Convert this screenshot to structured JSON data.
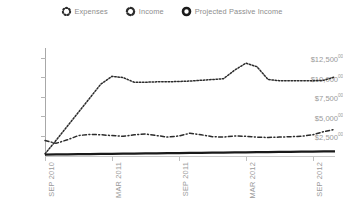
{
  "legend": {
    "items": [
      {
        "label": "Expenses",
        "icon": "dotted-ring-icon",
        "style": "dotted",
        "color": "#2b2b2b"
      },
      {
        "label": "Income",
        "icon": "dash-dot-ring-icon",
        "style": "dash-dot",
        "color": "#2b2b2b"
      },
      {
        "label": "Projected Passive Income",
        "icon": "solid-ring-icon",
        "style": "solid",
        "color": "#1a1a1a"
      }
    ]
  },
  "axes": {
    "y_ticks": [
      {
        "label": "$12,500",
        "cents": "00",
        "value": 12500
      },
      {
        "label": "$10,000",
        "cents": "00",
        "value": 10000
      },
      {
        "label": "$7,500",
        "cents": "00",
        "value": 7500
      },
      {
        "label": "$5,000",
        "cents": "00",
        "value": 5000
      },
      {
        "label": "$2,500",
        "cents": "00",
        "value": 2500
      }
    ],
    "x_ticks": [
      "SEP 2010",
      "MAR 2011",
      "SEP 2011",
      "MAR 2012",
      "SEP 2012"
    ]
  },
  "chart_data": {
    "type": "line",
    "title": "",
    "xlabel": "",
    "ylabel": "",
    "ylim": [
      0,
      13750
    ],
    "grid": false,
    "legend_position": "top-center",
    "x": [
      "SEP 2010",
      "OCT 2010",
      "NOV 2010",
      "DEC 2010",
      "JAN 2011",
      "FEB 2011",
      "MAR 2011",
      "APR 2011",
      "MAY 2011",
      "JUN 2011",
      "JUL 2011",
      "AUG 2011",
      "SEP 2011",
      "OCT 2011",
      "NOV 2011",
      "DEC 2011",
      "JAN 2012",
      "FEB 2012",
      "MAR 2012",
      "APR 2012",
      "MAY 2012",
      "JUN 2012",
      "JUL 2012",
      "AUG 2012",
      "SEP 2012",
      "OCT 2012",
      "NOV 2012"
    ],
    "series": [
      {
        "name": "Expenses",
        "style": "dotted",
        "color": "#2b2b2b",
        "values": [
          150,
          1900,
          3700,
          5500,
          7300,
          9100,
          10100,
          9950,
          9350,
          9350,
          9400,
          9400,
          9450,
          9500,
          9600,
          9700,
          9800,
          10900,
          11800,
          11350,
          9700,
          9550,
          9550,
          9550,
          9550,
          9600,
          10050
        ]
      },
      {
        "name": "Income",
        "style": "dash-dot",
        "color": "#2b2b2b",
        "values": [
          1850,
          1500,
          1950,
          2500,
          2650,
          2600,
          2500,
          2400,
          2600,
          2700,
          2500,
          2300,
          2450,
          2800,
          2600,
          2350,
          2300,
          2450,
          2400,
          2300,
          2250,
          2300,
          2350,
          2400,
          2600,
          3000,
          3300
        ]
      },
      {
        "name": "Projected Passive Income",
        "style": "solid",
        "color": "#1a1a1a",
        "values": [
          60,
          75,
          90,
          105,
          120,
          140,
          155,
          170,
          185,
          200,
          215,
          235,
          250,
          265,
          280,
          295,
          310,
          330,
          345,
          360,
          375,
          390,
          405,
          425,
          440,
          455,
          470
        ]
      }
    ]
  }
}
